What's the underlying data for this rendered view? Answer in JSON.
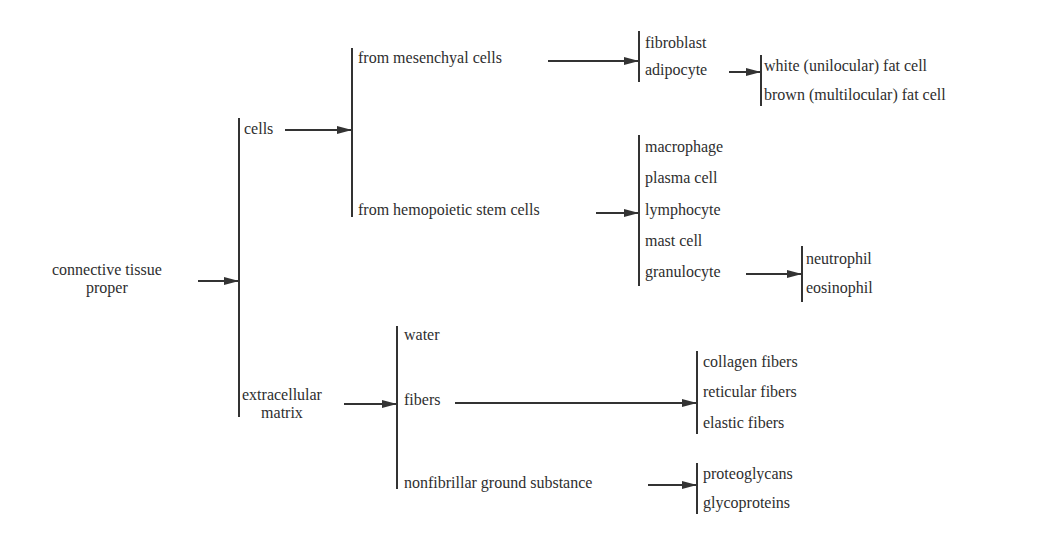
{
  "diagram": {
    "root": {
      "label_line1": "connective tissue",
      "label_line2": "proper"
    },
    "level1": {
      "cells": "cells",
      "ecm_line1": "extracellular",
      "ecm_line2": "matrix"
    },
    "cells_branch": {
      "mesenchymal": "from mesenchyal cells",
      "hemopoietic": "from hemopoietic stem cells"
    },
    "mesenchymal_children": [
      "fibroblast",
      "adipocyte"
    ],
    "adipocyte_children": [
      "white (unilocular) fat cell",
      "brown (multilocular) fat cell"
    ],
    "hemopoietic_children": [
      "macrophage",
      "plasma cell",
      "lymphocyte",
      "mast cell",
      "granulocyte"
    ],
    "granulocyte_children": [
      "neutrophil",
      "eosinophil"
    ],
    "ecm_branch": {
      "water": "water",
      "fibers": "fibers",
      "ground": "nonfibrillar ground substance"
    },
    "fibers_children": [
      "collagen fibers",
      "reticular fibers",
      "elastic fibers"
    ],
    "ground_children": [
      "proteoglycans",
      "glycoproteins"
    ]
  },
  "colors": {
    "text": "#2e2e2e",
    "lines": "#333333",
    "background": "#ffffff"
  }
}
